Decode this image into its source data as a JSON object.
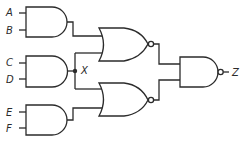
{
  "diagram": {
    "type": "logic-circuit",
    "inputs": [
      {
        "id": "A",
        "label": "A"
      },
      {
        "id": "B",
        "label": "B"
      },
      {
        "id": "C",
        "label": "C"
      },
      {
        "id": "D",
        "label": "D"
      },
      {
        "id": "E",
        "label": "E"
      },
      {
        "id": "F",
        "label": "F"
      }
    ],
    "internal_node": {
      "id": "X",
      "label": "X"
    },
    "output": {
      "id": "Z",
      "label": "Z"
    },
    "gates": [
      {
        "id": "and1",
        "type": "AND",
        "inputs": [
          "A",
          "B"
        ]
      },
      {
        "id": "and2",
        "type": "AND",
        "inputs": [
          "C",
          "D"
        ],
        "output": "X"
      },
      {
        "id": "and3",
        "type": "AND",
        "inputs": [
          "E",
          "F"
        ]
      },
      {
        "id": "nor1",
        "type": "NOR",
        "inputs": [
          "and1",
          "X"
        ]
      },
      {
        "id": "nor2",
        "type": "NOR",
        "inputs": [
          "X",
          "and3"
        ]
      },
      {
        "id": "nand1",
        "type": "NAND",
        "inputs": [
          "nor1",
          "nor2"
        ],
        "output": "Z"
      }
    ],
    "colors": {
      "line": "#2b2b2b",
      "background": "#ffffff"
    }
  }
}
